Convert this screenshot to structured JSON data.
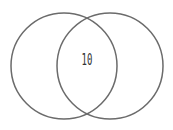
{
  "diagram": {
    "type": "venn",
    "sets": [
      {
        "id": "left",
        "cx": 64,
        "cy": 66,
        "r": 53
      },
      {
        "id": "right",
        "cx": 110,
        "cy": 66,
        "r": 53
      }
    ],
    "intersection_label": "10",
    "stroke_color": "#6b6b6b",
    "text_color": "#333333"
  }
}
